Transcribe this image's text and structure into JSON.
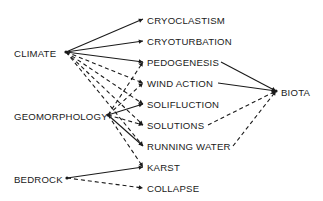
{
  "diagram": {
    "colors": {
      "line": "#1a1a1a",
      "text": "#1a1a1a",
      "background": "#ffffff"
    },
    "sources": [
      {
        "id": "climate",
        "label": "CLIMATE",
        "x": 14,
        "y": 53,
        "anchor": [
          66,
          52
        ]
      },
      {
        "id": "geomorphology",
        "label": "GEOMORPHOLOGY",
        "x": 14,
        "y": 116,
        "anchor": [
          108,
          115
        ]
      },
      {
        "id": "bedrock",
        "label": "BEDROCK",
        "x": 14,
        "y": 179,
        "anchor": [
          67,
          178
        ]
      }
    ],
    "processes": [
      {
        "id": "cryoclastism",
        "label": "CRYOCLASTISM",
        "x": 147,
        "y": 20,
        "anchor": [
          143,
          19
        ]
      },
      {
        "id": "cryoturbation",
        "label": "CRYOTURBATION",
        "x": 147,
        "y": 41,
        "anchor": [
          143,
          41
        ]
      },
      {
        "id": "pedogenesis",
        "label": "PEDOGENESIS",
        "x": 147,
        "y": 62,
        "anchor": [
          143,
          62
        ]
      },
      {
        "id": "wind_action",
        "label": "WIND ACTION",
        "x": 147,
        "y": 83,
        "anchor": [
          143,
          83
        ]
      },
      {
        "id": "solifluction",
        "label": "SOLIFLUCTION",
        "x": 147,
        "y": 104,
        "anchor": [
          143,
          104
        ]
      },
      {
        "id": "solutions",
        "label": "SOLUTIONS",
        "x": 147,
        "y": 125,
        "anchor": [
          143,
          125
        ]
      },
      {
        "id": "running_water",
        "label": "RUNNING WATER",
        "x": 147,
        "y": 146,
        "anchor": [
          143,
          146
        ]
      },
      {
        "id": "karst",
        "label": "KARST",
        "x": 147,
        "y": 167,
        "anchor": [
          143,
          167
        ]
      },
      {
        "id": "collapse",
        "label": "COLLAPSE",
        "x": 147,
        "y": 188,
        "anchor": [
          143,
          188
        ]
      }
    ],
    "targets": [
      {
        "id": "biota",
        "label": "BIOTA",
        "x": 281,
        "y": 92,
        "anchor": [
          276,
          91
        ]
      }
    ],
    "edges": [
      {
        "from": "climate",
        "to": "cryoclastism",
        "style": "solid"
      },
      {
        "from": "climate",
        "to": "cryoturbation",
        "style": "solid"
      },
      {
        "from": "climate",
        "to": "pedogenesis",
        "style": "solid"
      },
      {
        "from": "climate",
        "to": "wind_action",
        "style": "dashed"
      },
      {
        "from": "climate",
        "to": "solifluction",
        "style": "dashed"
      },
      {
        "from": "climate",
        "to": "solutions",
        "style": "dashed"
      },
      {
        "from": "climate",
        "to": "running_water",
        "style": "dashed"
      },
      {
        "from": "geomorphology",
        "to": "pedogenesis",
        "style": "dashed"
      },
      {
        "from": "geomorphology",
        "to": "wind_action",
        "style": "dashed"
      },
      {
        "from": "geomorphology",
        "to": "solifluction",
        "style": "solid"
      },
      {
        "from": "geomorphology",
        "to": "solutions",
        "style": "dashed"
      },
      {
        "from": "geomorphology",
        "to": "running_water",
        "style": "solid"
      },
      {
        "from": "geomorphology",
        "to": "karst",
        "style": "dashed"
      },
      {
        "from": "bedrock",
        "to": "karst",
        "style": "solid"
      },
      {
        "from": "bedrock",
        "to": "collapse",
        "style": "dashed"
      },
      {
        "from": "pedogenesis",
        "to": "biota",
        "style": "solid",
        "fromEnd": true
      },
      {
        "from": "wind_action",
        "to": "biota",
        "style": "solid",
        "fromEnd": true
      },
      {
        "from": "solutions",
        "to": "biota",
        "style": "dashed",
        "fromEnd": true
      },
      {
        "from": "running_water",
        "to": "biota",
        "style": "dashed",
        "fromEnd": true
      }
    ],
    "process_right_ends": {
      "pedogenesis": [
        221,
        62
      ],
      "wind_action": [
        218,
        83
      ],
      "solutions": [
        208,
        125
      ],
      "running_water": [
        233,
        146
      ]
    }
  }
}
